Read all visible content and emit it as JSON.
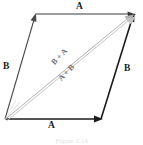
{
  "figure": {
    "type": "vector-parallelogram-diagram",
    "caption": "Figure 2.14",
    "colors": {
      "vector_stroke": "#1b1b1b",
      "resultant_stroke": "#9a9a9a",
      "label_text": "#1b1b1b",
      "resultant_label_text": "#6f6f6f",
      "background": "#ffffff"
    }
  },
  "labels": {
    "a_top": "A",
    "a_bottom": "A",
    "b_left": "B",
    "b_right": "B",
    "sum_ba": "B + A",
    "sum_ab": "A + B"
  },
  "geometry": {
    "origin": {
      "x": 5,
      "y": 119
    },
    "bottom_right": {
      "x": 101,
      "y": 119
    },
    "top_left": {
      "x": 36,
      "y": 14
    },
    "top_right": {
      "x": 134,
      "y": 14
    },
    "vectors": [
      {
        "name": "A-bottom",
        "from": "origin",
        "to": "bottom_right",
        "arrow": true,
        "style": "solid-black"
      },
      {
        "name": "B-left",
        "from": "origin",
        "to": "top_left",
        "arrow": true,
        "style": "solid-black"
      },
      {
        "name": "A-top",
        "from": "top_left",
        "to": "top_right",
        "arrow": true,
        "style": "solid-black"
      },
      {
        "name": "B-right",
        "from": "bottom_right",
        "to": "top_right",
        "arrow": true,
        "style": "solid-black"
      },
      {
        "name": "resultant-B-plus-A",
        "from": "origin",
        "to": "top_right",
        "arrow": true,
        "style": "double-gray"
      },
      {
        "name": "resultant-A-plus-B",
        "from": "origin",
        "to": "top_right",
        "arrow": true,
        "style": "double-gray"
      }
    ]
  }
}
